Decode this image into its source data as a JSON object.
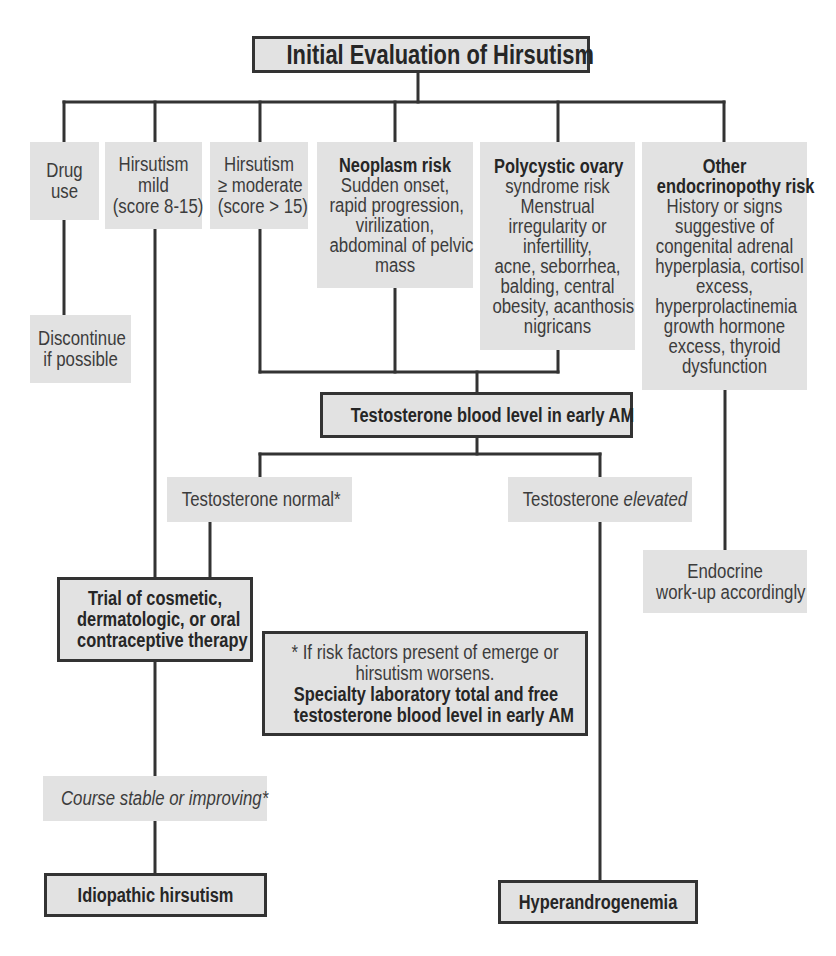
{
  "title": "Initial Evaluation of Hirsutism",
  "colors": {
    "box_fill": "#e2e2e2",
    "line": "#333333",
    "text": "#3c3c3c",
    "bold_text": "#262626",
    "background": "#ffffff"
  },
  "nodes": {
    "drug_use": {
      "lines": [
        "Drug",
        "use"
      ]
    },
    "hirsutism_mild": {
      "lines": [
        "Hirsutism",
        "mild",
        "(score 8-15)"
      ]
    },
    "hirsutism_moderate": {
      "lines": [
        "Hirsutism",
        "≥ moderate",
        "(score > 15)"
      ]
    },
    "neoplasm_risk": {
      "heading": "Neoplasm risk",
      "lines": [
        "Sudden onset,",
        "rapid progression,",
        "virilization,",
        "abdominal of pelvic",
        "mass"
      ]
    },
    "pcos_risk": {
      "heading": "Polycystic ovary",
      "lines": [
        "syndrome risk",
        "Menstrual",
        "irregularity or",
        "infertillity,",
        "acne, seborrhea,",
        "balding, central",
        "obesity, acanthosis",
        "nigricans"
      ]
    },
    "other_endocrinopathy_risk": {
      "heading_lines": [
        "Other",
        "endocrinopothy risk"
      ],
      "lines": [
        "History or signs",
        "suggestive of",
        "congenital adrenal",
        "hyperplasia, cortisol",
        "excess,",
        "hyperprolactinemia",
        "growth hormone",
        "excess, thyroid",
        "dysfunction"
      ]
    },
    "discontinue": {
      "lines": [
        "Discontinue",
        "if possible"
      ]
    },
    "testosterone_level": {
      "label": "Testosterone blood level in early AM"
    },
    "testosterone_normal": {
      "label": "Testosterone normal*"
    },
    "testosterone_elevated": {
      "prefix": "Testosterone",
      "emphasis": "elevated"
    },
    "endocrine_workup": {
      "lines": [
        "Endocrine",
        "work-up accordingly"
      ]
    },
    "trial_therapy": {
      "lines": [
        "Trial of cosmetic,",
        "dermatologic, or oral",
        "contraceptive therapy"
      ]
    },
    "footnote": {
      "lines": [
        "* If risk factors present of emerge or",
        "hirsutism worsens."
      ],
      "bold_lines": [
        "Specialty laboratory total and free",
        "testosterone blood level in early AM"
      ]
    },
    "course_stable": {
      "label": "Course stable or improving*"
    },
    "idiopathic": {
      "label": "Idiopathic hirsutism"
    },
    "hyperandrogenemia": {
      "label": "Hyperandrogenemia"
    }
  },
  "edges": [
    [
      "title",
      "drug_use"
    ],
    [
      "title",
      "hirsutism_mild"
    ],
    [
      "title",
      "hirsutism_moderate"
    ],
    [
      "title",
      "neoplasm_risk"
    ],
    [
      "title",
      "pcos_risk"
    ],
    [
      "title",
      "other_endocrinopathy_risk"
    ],
    [
      "drug_use",
      "discontinue"
    ],
    [
      "hirsutism_mild",
      "trial_therapy"
    ],
    [
      "hirsutism_moderate",
      "testosterone_level"
    ],
    [
      "neoplasm_risk",
      "testosterone_level"
    ],
    [
      "pcos_risk",
      "testosterone_level"
    ],
    [
      "other_endocrinopathy_risk",
      "endocrine_workup"
    ],
    [
      "testosterone_level",
      "testosterone_normal"
    ],
    [
      "testosterone_level",
      "testosterone_elevated"
    ],
    [
      "testosterone_normal",
      "trial_therapy"
    ],
    [
      "trial_therapy",
      "course_stable"
    ],
    [
      "course_stable",
      "idiopathic"
    ],
    [
      "testosterone_elevated",
      "hyperandrogenemia"
    ]
  ]
}
